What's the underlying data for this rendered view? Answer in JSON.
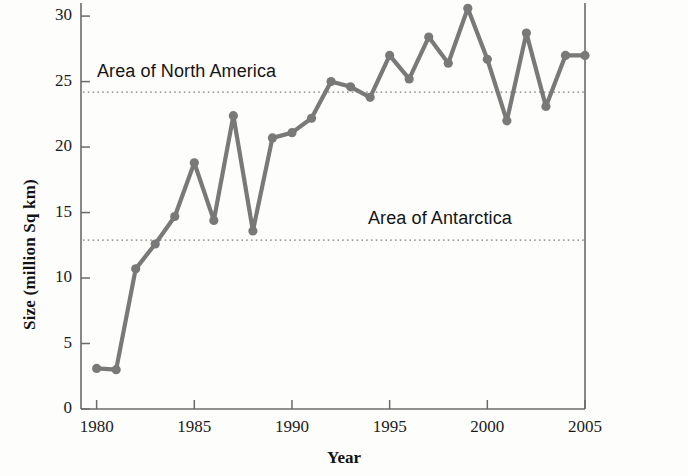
{
  "chart_data": {
    "type": "line",
    "title": "",
    "xlabel": "Year",
    "ylabel": "Size (million Sq km)",
    "xlim": [
      1979.2,
      2005.0
    ],
    "ylim": [
      0,
      31
    ],
    "grid": false,
    "legend_position": "inline-annotation",
    "x": [
      1980,
      1981,
      1982,
      1983,
      1984,
      1985,
      1986,
      1987,
      1988,
      1989,
      1990,
      1991,
      1992,
      1993,
      1994,
      1995,
      1996,
      1997,
      1998,
      1999,
      2000,
      2001,
      2002,
      2003,
      2004,
      2005
    ],
    "values": [
      3.1,
      3.0,
      10.7,
      12.6,
      14.7,
      18.8,
      14.4,
      22.4,
      13.6,
      20.7,
      21.1,
      22.2,
      25.0,
      24.6,
      23.8,
      27.0,
      25.2,
      28.4,
      26.4,
      30.6,
      26.7,
      22.0,
      28.7,
      23.1,
      27.0,
      27.0
    ],
    "series": [
      {
        "name": "Ozone hole size",
        "color": "#797979",
        "marker": "circle",
        "values": [
          3.1,
          3.0,
          10.7,
          12.6,
          14.7,
          18.8,
          14.4,
          22.4,
          13.6,
          20.7,
          21.1,
          22.2,
          25.0,
          24.6,
          23.8,
          27.0,
          25.2,
          28.4,
          26.4,
          30.6,
          26.7,
          22.0,
          28.7,
          23.1,
          27.0,
          27.0
        ]
      }
    ],
    "xticks": [
      1980,
      1985,
      1990,
      1995,
      2000,
      2005
    ],
    "xtick_labels": [
      "1980",
      "1985",
      "1990",
      "1995",
      "2000",
      "2005"
    ],
    "yticks": [
      0,
      5,
      10,
      15,
      20,
      25,
      30
    ],
    "ytick_labels": [
      "0",
      "5",
      "10",
      "15",
      "20",
      "25",
      "30"
    ],
    "reference_lines": [
      {
        "label": "Area of North America",
        "value": 24.2,
        "style": "dotted",
        "color": "#7d7d7d"
      },
      {
        "label": "Area of Antarctica",
        "value": 12.9,
        "style": "dotted",
        "color": "#7d7d7d"
      }
    ],
    "annotations": [
      {
        "text": "Area of North America",
        "x": 1980.2,
        "y": 25.3
      },
      {
        "text": "Area of Antarctica",
        "x": 1994.0,
        "y": 14.4
      }
    ]
  }
}
